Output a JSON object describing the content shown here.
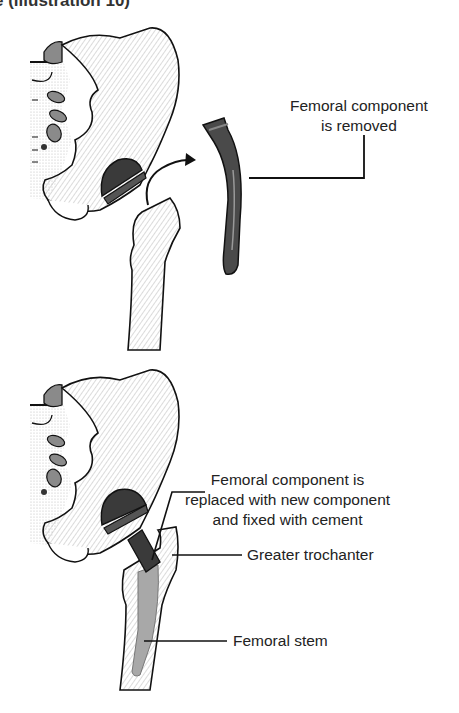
{
  "header": {
    "clipped_text": "e (illustration 10)"
  },
  "figures": [
    {
      "id": "removal",
      "description": "Old femoral component removed from femur; acetabular cup remains in pelvis",
      "labels": [
        {
          "id": "femoral-component-removed",
          "line1": "Femoral component",
          "line2": "is removed"
        }
      ],
      "arrow": "curved-arrow-out-of-femur"
    },
    {
      "id": "replacement",
      "description": "New femoral component inserted and cemented into femur",
      "labels": [
        {
          "id": "femoral-component-replaced",
          "line1": "Femoral component is",
          "line2": "replaced with new component",
          "line3": "and fixed with cement"
        },
        {
          "id": "greater-trochanter",
          "text": "Greater trochanter"
        },
        {
          "id": "femoral-stem",
          "text": "Femoral stem"
        }
      ]
    }
  ],
  "colors": {
    "implant_dark": "#3a3a3a",
    "implant_mid": "#6b6b6b",
    "bone_outline": "#111111",
    "bone_shading": "#9a9a9a",
    "stem_gray": "#a8a8a8",
    "leader_line": "#111111"
  }
}
